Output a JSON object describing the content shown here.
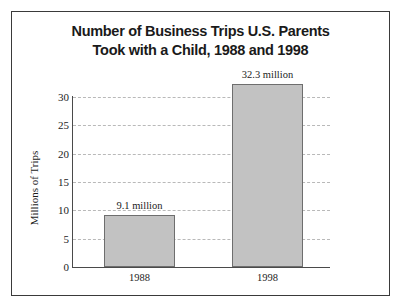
{
  "chart_data": {
    "type": "bar",
    "title": "Number of Business Trips U.S. Parents\nTook with a Child, 1988 and 1998",
    "categories": [
      "1988",
      "1998"
    ],
    "values": [
      9.1,
      32.3
    ],
    "data_labels": [
      "9.1 million",
      "32.3 million"
    ],
    "xlabel": "",
    "ylabel": "Millions of Trips",
    "ylim": [
      0,
      30
    ],
    "ytick_labels": [
      "0",
      "5",
      "10",
      "15",
      "20",
      "25",
      "30"
    ],
    "ytick_values": [
      0,
      5,
      10,
      15,
      20,
      25,
      30
    ],
    "grid": "horizontal-dashed",
    "legend": "none",
    "bar_fill_color": "#c2c2c2",
    "bar_edge_color": "#6e6e6e",
    "gridline_color": "#b9b9b9",
    "axis_color": "#4a4a4a",
    "frame_color": "#3a3a3a",
    "background_color": "#ffffff",
    "text_color": "#1c1c1c"
  }
}
